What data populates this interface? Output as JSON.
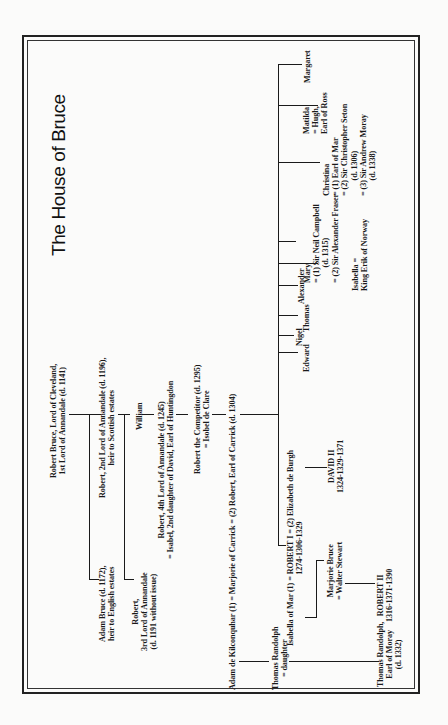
{
  "title": "The House of Bruce",
  "orientation": "rotated -90deg (reads bottom-to-top)",
  "people": {
    "robert_bruce_1": "Robert Bruce, Lord of Cleveland,\n1st Lord of Annandale (d. 1141)",
    "adam_bruce": "Adam Bruce (d. 1172),\nheir to English estates",
    "robert_2nd": "Robert, 2nd Lord of Annandale (d. 1196),\nheir to Scottish estates",
    "robert_3rd": "Robert,\n3rd Lord of Annandale\n(d. 1191 without issue)",
    "william": "William",
    "robert_4th": "Robert, 4th Lord of Annandale (d. 1245)\n= Isabel, 2nd daughter of David, Earl of Huntingdon",
    "robert_competitor": "Robert the Competitor (d. 1295)\n= Isobel de Clare",
    "carrick_marriage": "Adam de Kilconquhar (1) = Marjorie of Carrick = (2) Robert, Earl of Carrick (d. 1304)",
    "thomas_randolph_sr": "Thomas Randolph\n= daughter",
    "robert_i": "Isabella of Mar (1) = ROBERT I = (2) Elizabeth de Burgh\n1274-1306-1329",
    "marjorie_bruce": "Marjorie Bruce\n= Walter Stewart",
    "robert_ii": "ROBERT II\n1316-1371-1390",
    "thomas_randolph_jr": "Thomas Randolph,\nEarl of Moray\n(d. 1332)",
    "david_ii": "DAVID II\n1324-1329-1371",
    "edward": "Edward",
    "nigel": "Nigel",
    "thomas": "Thomas",
    "alexander": "Alexander",
    "mary": "Mary\n= (1) Sir Neil Campbell\n        (d. 1315)\n= (2) Sir Alexander Fraser",
    "isabella": "Isabella =\nKing Erik of Norway",
    "christina": "Christina\n= (1) Earl of Mar\n= (2) Sir Christopher Seton\n        (d. 1306)\n= (3) Sir Andrew Moray\n        (d. 1338)",
    "matilda": "Matilda\n= Hugh,\nEarl of Ross",
    "margaret": "Margaret"
  }
}
